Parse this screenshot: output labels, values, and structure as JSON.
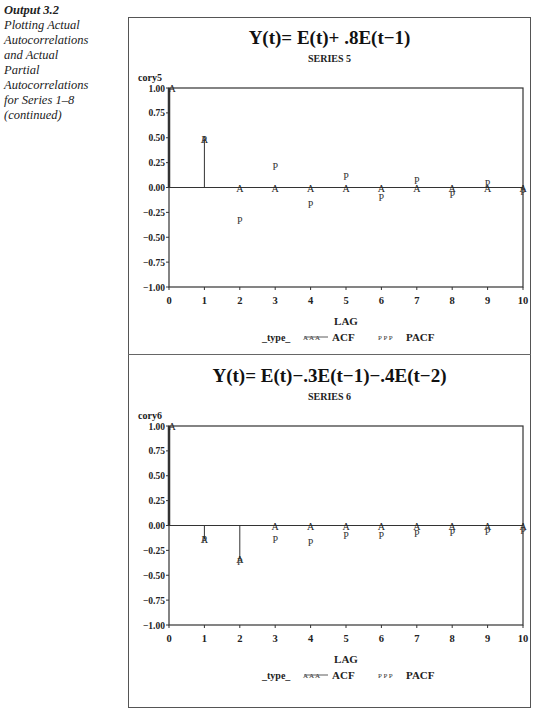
{
  "caption": {
    "heading": "Output 3.2",
    "lines": [
      "Plotting Actual",
      "Autocorrelations",
      "and Actual",
      "Partial",
      "Autocorrelations",
      "for Series 1–8",
      "(continued)"
    ]
  },
  "legend": {
    "label": "_type_",
    "acf_symbol": "A A A",
    "acf_label": "ACF",
    "pacf_symbol": "P P P",
    "pacf_label": "PACF"
  },
  "chart_data": [
    {
      "type": "scatter",
      "title": "Y(t)= E(t)+ .8E(t−1)",
      "subtitle": "SERIES 5",
      "ylabel": "cory5",
      "xlabel": "LAG",
      "x": [
        0,
        1,
        2,
        3,
        4,
        5,
        6,
        7,
        8,
        9,
        10
      ],
      "ylim": [
        -1.0,
        1.0
      ],
      "yticks": [
        "1.00",
        "0.75",
        "0.50",
        "0.25",
        "0.00",
        "-0.25",
        "-0.50",
        "-0.75",
        "-1.00"
      ],
      "xticks": [
        "0",
        "1",
        "2",
        "3",
        "4",
        "5",
        "6",
        "7",
        "8",
        "9",
        "10"
      ],
      "series": [
        {
          "name": "ACF",
          "symbol": "A",
          "values": [
            1.0,
            0.49,
            0.0,
            0.0,
            0.0,
            0.0,
            0.0,
            0.0,
            0.0,
            0.0,
            0.0
          ]
        },
        {
          "name": "PACF",
          "symbol": "P",
          "values": [
            null,
            0.49,
            -0.33,
            0.22,
            -0.17,
            0.12,
            -0.1,
            0.08,
            -0.07,
            0.05,
            -0.04
          ]
        }
      ],
      "needles": "ACF",
      "legend_position": "bottom"
    },
    {
      "type": "scatter",
      "title": "Y(t)= E(t)−.3E(t−1)−.4E(t−2)",
      "subtitle": "SERIES 6",
      "ylabel": "cory6",
      "xlabel": "LAG",
      "x": [
        0,
        1,
        2,
        3,
        4,
        5,
        6,
        7,
        8,
        9,
        10
      ],
      "ylim": [
        -1.0,
        1.0
      ],
      "yticks": [
        "1.00",
        "0.75",
        "0.50",
        "0.25",
        "0.00",
        "-0.25",
        "-0.50",
        "-0.75",
        "-1.00"
      ],
      "xticks": [
        "0",
        "1",
        "2",
        "3",
        "4",
        "5",
        "6",
        "7",
        "8",
        "9",
        "10"
      ],
      "series": [
        {
          "name": "ACF",
          "symbol": "A",
          "values": [
            1.0,
            -0.14,
            -0.34,
            0.0,
            0.0,
            0.0,
            0.0,
            0.0,
            0.0,
            0.0,
            0.0
          ]
        },
        {
          "name": "PACF",
          "symbol": "P",
          "values": [
            null,
            -0.14,
            -0.36,
            -0.14,
            -0.17,
            -0.1,
            -0.1,
            -0.08,
            -0.07,
            -0.06,
            -0.05
          ]
        }
      ],
      "needles": "ACF",
      "legend_position": "bottom"
    }
  ]
}
